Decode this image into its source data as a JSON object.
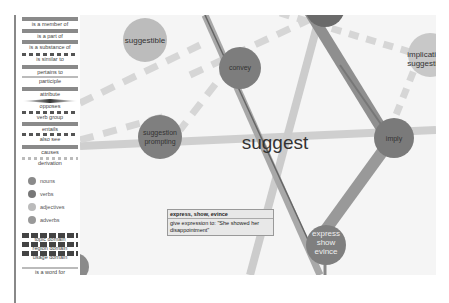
{
  "legend": {
    "relations": [
      {
        "label": "is a member of",
        "style": "bar"
      },
      {
        "label": "is a part of",
        "style": "bar"
      },
      {
        "label": "is a substance of",
        "style": "bar"
      },
      {
        "label": "is similar to",
        "style": "dash"
      },
      {
        "label": "pertains to",
        "style": "bar"
      },
      {
        "label": "participle",
        "style": "thin"
      },
      {
        "label": "attribute",
        "style": "bar"
      },
      {
        "label": "opposes",
        "style": "diamond"
      },
      {
        "label": "verb group",
        "style": "dash"
      },
      {
        "label": "entails",
        "style": "bar"
      },
      {
        "label": "also see",
        "style": "dash"
      },
      {
        "label": "causes",
        "style": "bar"
      },
      {
        "label": "derivation",
        "style": "dash-light"
      }
    ],
    "node_types": [
      {
        "label": "nouns",
        "color": "#8a8a8a"
      },
      {
        "label": "verbs",
        "color": "#777777"
      },
      {
        "label": "adjectives",
        "color": "#bbbbbb"
      },
      {
        "label": "adverbs",
        "color": "#999999"
      }
    ],
    "domains": [
      {
        "label": "topic domain"
      },
      {
        "label": "region domain"
      },
      {
        "label": "usage domain"
      }
    ],
    "word_for": {
      "label": "is a word for"
    }
  },
  "graph": {
    "center_word": "suggest",
    "nodes": [
      {
        "id": "suggestible",
        "label": [
          "suggestible"
        ],
        "type": "adjective"
      },
      {
        "id": "convey",
        "label": [
          "convey"
        ],
        "type": "verb"
      },
      {
        "id": "top",
        "label": [],
        "type": "verb"
      },
      {
        "id": "implicative",
        "label": [
          "implicati",
          "suggesti"
        ],
        "type": "adjective"
      },
      {
        "id": "suggestion",
        "label": [
          "suggestion",
          "prompting"
        ],
        "type": "noun"
      },
      {
        "id": "imply",
        "label": [
          "imply"
        ],
        "type": "verb"
      },
      {
        "id": "express",
        "label": [
          "express",
          "show",
          "evince"
        ],
        "type": "verb"
      },
      {
        "id": "bottomleft",
        "label": [],
        "type": "noun"
      }
    ]
  },
  "tooltip": {
    "title": "express, show, evince",
    "definition": "give expression to: \"She showed her disappointment\""
  }
}
